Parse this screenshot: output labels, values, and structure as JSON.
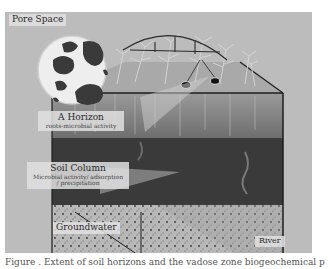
{
  "figure": {
    "labels": {
      "pore_space": "Pore Space",
      "a_horizon": {
        "title": "A Horizon",
        "sub": "roots-microbial activity"
      },
      "soil_column": {
        "title": "Soil Column",
        "sub1": "Microbial activity/ adsorption",
        "sub2": "/ precipitation"
      },
      "groundwater": "Groundwater",
      "river": "River"
    },
    "colors": {
      "background": "#bcbcbc",
      "top_face": "#a9a9a9",
      "a_horizon": "#8a8a8a",
      "soil_dark": "#3a3a3a",
      "groundwater": "#b5b5b5",
      "edge": "#1e1e1e"
    },
    "icons": [
      "pore-space-magnifier-icon",
      "corn-plants-icon",
      "irrigation-arc-icon",
      "sensor-probe-icon"
    ]
  },
  "caption": {
    "text": "Figure  .  Extent of soil horizons and the vadose zone biogeochemical processes"
  }
}
